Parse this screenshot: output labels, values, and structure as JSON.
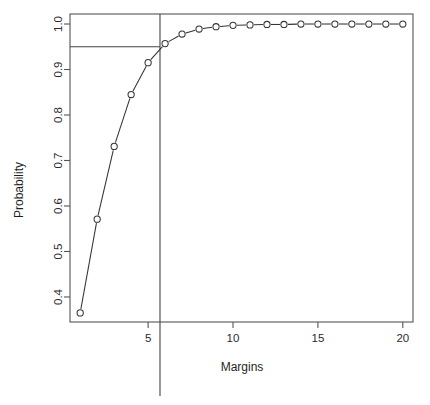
{
  "chart_data": {
    "type": "line",
    "title": "",
    "xlabel": "Margins",
    "ylabel": "Probability",
    "xlim": [
      0.4,
      20.6
    ],
    "ylim": [
      0.345,
      1.022
    ],
    "grid": false,
    "legend": "none",
    "marker": "open-circle",
    "x": [
      1,
      2,
      3,
      4,
      5,
      6,
      7,
      8,
      9,
      10,
      11,
      12,
      13,
      14,
      15,
      16,
      17,
      18,
      19,
      20
    ],
    "y": [
      0.365,
      0.571,
      0.731,
      0.845,
      0.915,
      0.957,
      0.978,
      0.989,
      0.994,
      0.997,
      0.998,
      0.999,
      0.999,
      1.0,
      1.0,
      1.0,
      1.0,
      1.0,
      1.0,
      1.0
    ],
    "xticks": [
      5,
      10,
      15,
      20
    ],
    "xtick_labels": [
      "5",
      "10",
      "15",
      "20"
    ],
    "yticks": [
      0.4,
      0.5,
      0.6,
      0.7,
      0.8,
      0.9,
      1.0
    ],
    "ytick_labels": [
      "0.4",
      "0.5",
      "0.6",
      "0.7",
      "0.8",
      "0.9",
      "1.0"
    ],
    "reference_lines": [
      {
        "name": "probability-threshold",
        "orientation": "horizontal",
        "value": 0.95
      },
      {
        "name": "margin-threshold",
        "orientation": "vertical",
        "value": 5.7
      }
    ],
    "colors": {
      "line": "#333333",
      "marker": "#333333",
      "axis": "#555555",
      "text": "#2b2b2b",
      "reference": "#444444",
      "background": "#ffffff"
    }
  }
}
